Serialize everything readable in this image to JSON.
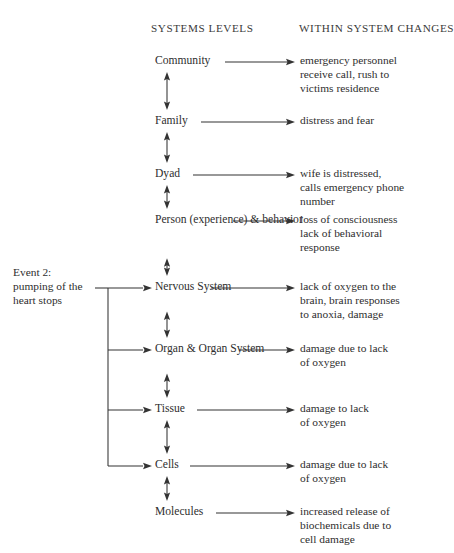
{
  "headers": {
    "left": "SYSTEMS LEVELS",
    "right": "WITHIN SYSTEM CHANGES"
  },
  "event": {
    "label": "Event 2:\npumping of the\nheart stops"
  },
  "rows": [
    {
      "level": "Community",
      "change": "emergency personnel\nreceive call, rush to\nvictims residence",
      "y": 62,
      "label_width": 62,
      "trunk_branch": false,
      "arrow_up_to_prev": false
    },
    {
      "level": "Family",
      "change": "distress and fear",
      "y": 122,
      "label_width": 38,
      "trunk_branch": false,
      "arrow_up_to_prev": true
    },
    {
      "level": "Dyad",
      "change": "wife is distressed,\ncalls emergency phone\nnumber",
      "y": 175,
      "label_width": 30,
      "trunk_branch": false,
      "arrow_up_to_prev": true
    },
    {
      "level": "Person\n(experience)\n& behavior",
      "change": "loss of consciousness\nlack of behavioral\nresponse",
      "y": 221,
      "label_width": 70,
      "trunk_branch": false,
      "arrow_up_to_prev": true
    },
    {
      "level": "Nervous\nSystem",
      "change": "lack of oxygen to the\nbrain, brain responses\nto anoxia, damage",
      "y": 288,
      "label_width": 48,
      "trunk_branch": true,
      "arrow_up_to_prev": true
    },
    {
      "level": "Organ &\nOrgan System",
      "change": "damage due to lack\nof oxygen",
      "y": 350,
      "label_width": 76,
      "trunk_branch": true,
      "arrow_up_to_prev": true
    },
    {
      "level": "Tissue",
      "change": "damage to lack\nof oxygen",
      "y": 410,
      "label_width": 34,
      "trunk_branch": true,
      "arrow_up_to_prev": true
    },
    {
      "level": "Cells",
      "change": "damage due to lack\nof oxygen",
      "y": 466,
      "label_width": 27,
      "trunk_branch": true,
      "arrow_up_to_prev": true
    },
    {
      "level": "Molecules",
      "change": "increased release of\nbiochemicals due to\ncell damage",
      "y": 513,
      "label_width": 53,
      "trunk_branch": false,
      "arrow_up_to_prev": true
    }
  ],
  "colors": {
    "ink": "#333333",
    "background": "#ffffff"
  }
}
